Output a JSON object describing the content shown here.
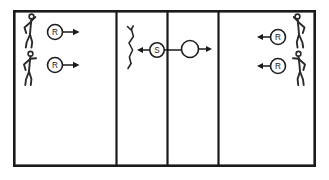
{
  "diagram": {
    "court": {
      "x": 13,
      "y": 10,
      "width": 303,
      "height": 157,
      "border_color": "#1a1a1a"
    },
    "zones": [
      {
        "id": "zone-left",
        "label": "",
        "x": 13,
        "width": 103
      },
      {
        "id": "zone-mid-left",
        "label": "",
        "x": 116,
        "width": 51
      },
      {
        "id": "zone-mid-right",
        "label": "",
        "x": 167,
        "width": 51
      },
      {
        "id": "zone-right",
        "label": "",
        "x": 218,
        "width": 98
      }
    ],
    "dividers": [
      {
        "id": "divider-1",
        "x": 116
      },
      {
        "id": "divider-2",
        "x": 167
      },
      {
        "id": "divider-3",
        "x": 218
      }
    ],
    "players": [
      {
        "id": "player-left-top",
        "zone": "zone-left",
        "pose": "arm-raised",
        "facing": "right",
        "x": 30,
        "y": 14
      },
      {
        "id": "player-left-bottom",
        "zone": "zone-left",
        "pose": "arms-forward",
        "facing": "right",
        "x": 30,
        "y": 52
      },
      {
        "id": "player-middle",
        "zone": "zone-mid-left",
        "pose": "standing-slim",
        "facing": "right",
        "x": 130,
        "y": 24
      },
      {
        "id": "player-right-top",
        "zone": "zone-right",
        "pose": "arm-raised",
        "facing": "left",
        "x": 299,
        "y": 14
      },
      {
        "id": "player-right-bottom",
        "zone": "zone-right",
        "pose": "arms-forward",
        "facing": "left",
        "x": 299,
        "y": 52
      }
    ],
    "markers": [
      {
        "id": "marker-r-left-top",
        "label": "R",
        "role": "receiver",
        "cx": 55,
        "cy": 32,
        "r": 7.5,
        "arrow_direction": "right"
      },
      {
        "id": "marker-r-left-bottom",
        "label": "R",
        "role": "receiver",
        "cx": 55,
        "cy": 65,
        "r": 7.5,
        "arrow_direction": "right"
      },
      {
        "id": "marker-s-middle",
        "label": "S",
        "role": "setter",
        "cx": 157,
        "cy": 50,
        "r": 7.2,
        "arrow_direction": "left"
      },
      {
        "id": "marker-ball-middle",
        "label": "",
        "role": "ball",
        "cx": 190,
        "cy": 49,
        "r": 8.5,
        "arrow_direction": "right"
      },
      {
        "id": "marker-r-right-top",
        "label": "R",
        "role": "receiver",
        "cx": 278,
        "cy": 37,
        "r": 7.5,
        "arrow_direction": "left"
      },
      {
        "id": "marker-r-right-bottom",
        "label": "R",
        "role": "receiver",
        "cx": 278,
        "cy": 66,
        "r": 7.5,
        "arrow_direction": "left"
      }
    ],
    "colors": {
      "ink": "#1a1a1a",
      "figure": "#2a2a2a",
      "background": "#ffffff"
    }
  }
}
